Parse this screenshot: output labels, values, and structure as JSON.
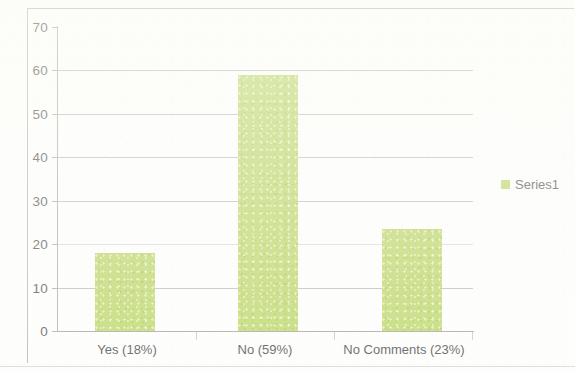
{
  "chart_data": {
    "type": "bar",
    "title": "",
    "subtitle": "",
    "xlabel": "",
    "ylabel": "",
    "categories": [
      "Yes (18%)",
      "No (59%)",
      "No Comments (23%)"
    ],
    "values": [
      18,
      59,
      23.5
    ],
    "series": [
      {
        "name": "Series1",
        "values": [
          18,
          59,
          23.5
        ]
      }
    ],
    "ylim": [
      0,
      70
    ],
    "ytick_labels": [
      "0",
      "10",
      "20",
      "30",
      "40",
      "50",
      "60",
      "70"
    ],
    "ytick_values": [
      0,
      10,
      20,
      30,
      40,
      50,
      60,
      70
    ],
    "gridlines": true,
    "grid_axis": "y",
    "legend": {
      "position": "right",
      "entries": [
        {
          "label": "Series1",
          "color": "#b9d45e"
        }
      ]
    },
    "bar_color": "#b9d45e",
    "axis_color": "#a6a6a4",
    "gridline_color": "#a8a8a6",
    "background": "#fdfdfb"
  }
}
